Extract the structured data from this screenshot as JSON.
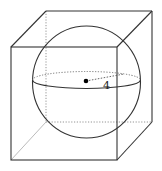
{
  "diagram": {
    "radius_label": "4",
    "colors": {
      "stroke": "#333333",
      "hidden_stroke": "#888888",
      "background": "#ffffff",
      "center_dot": "#000000"
    },
    "cube": {
      "front_face": {
        "x1": 11,
        "y1": 47,
        "x2": 117,
        "y2": 160
      },
      "back_face": {
        "x1": 46,
        "y1": 11,
        "x2": 152,
        "y2": 122
      }
    },
    "sphere": {
      "cx": 86.5,
      "cy": 82,
      "rx": 54,
      "ry": 56
    },
    "equator": {
      "cx": 86.5,
      "cy": 80,
      "rx": 54,
      "ry": 8.5
    },
    "center_point": {
      "x": 86,
      "y": 81
    },
    "radius_end": {
      "x": 124,
      "y": 74
    },
    "label_position": {
      "x": 103,
      "y": 89
    }
  }
}
